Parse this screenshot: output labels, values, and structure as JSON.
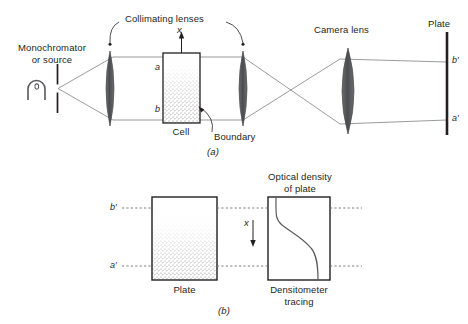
{
  "figure": {
    "panels": [
      {
        "id": "a",
        "caption": "(a)",
        "labels": {
          "source": "Monochromator\nor source",
          "source_line1": "Monochromator",
          "source_line2": "or source",
          "collimating_lenses": "Collimating lenses",
          "camera_lens": "Camera lens",
          "plate": "Plate",
          "cell": "Cell",
          "boundary": "Boundary",
          "axis_x": "x",
          "cell_top_level": "a",
          "cell_bottom_level": "b",
          "plate_top_level": "b′",
          "plate_bottom_level": "a′"
        }
      },
      {
        "id": "b",
        "caption": "(b)",
        "labels": {
          "plate": "Plate",
          "optical_density_line1": "Optical density",
          "optical_density_line2": "of plate",
          "densitometer_line1": "Densitometer",
          "densitometer_line2": "tracing",
          "axis_x": "x",
          "level_top": "b′",
          "level_bottom": "a′"
        }
      }
    ],
    "colors": {
      "ink": "#231f20",
      "ray": "#6d6e71",
      "lens_fill": "#58595b",
      "stipple": "#808285",
      "dashed": "#6d6e71"
    }
  }
}
